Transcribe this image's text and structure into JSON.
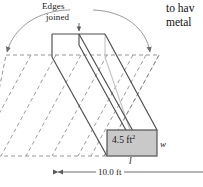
{
  "figure": {
    "name": "rolled-metal-sheet-diagram",
    "labels": {
      "edges": "Edges",
      "joined": "joined",
      "cross_section_area": "4.5 ft",
      "cross_section_area_exponent": "2",
      "width_symbol": "w",
      "length_symbol": "l",
      "overall_width": "10.0 ft"
    },
    "colors": {
      "solid_line": "#4d4d4d",
      "dashed_line": "#8a8a8a",
      "hidden_line": "#c4c4c4",
      "shaded_fill": "#c9c9c9",
      "shaded_stroke": "#4d4d4d",
      "text": "#1a1a1a",
      "background": "#ffffff"
    }
  },
  "adjacent_text": {
    "line_1": "to hav",
    "line_2": "metal"
  }
}
